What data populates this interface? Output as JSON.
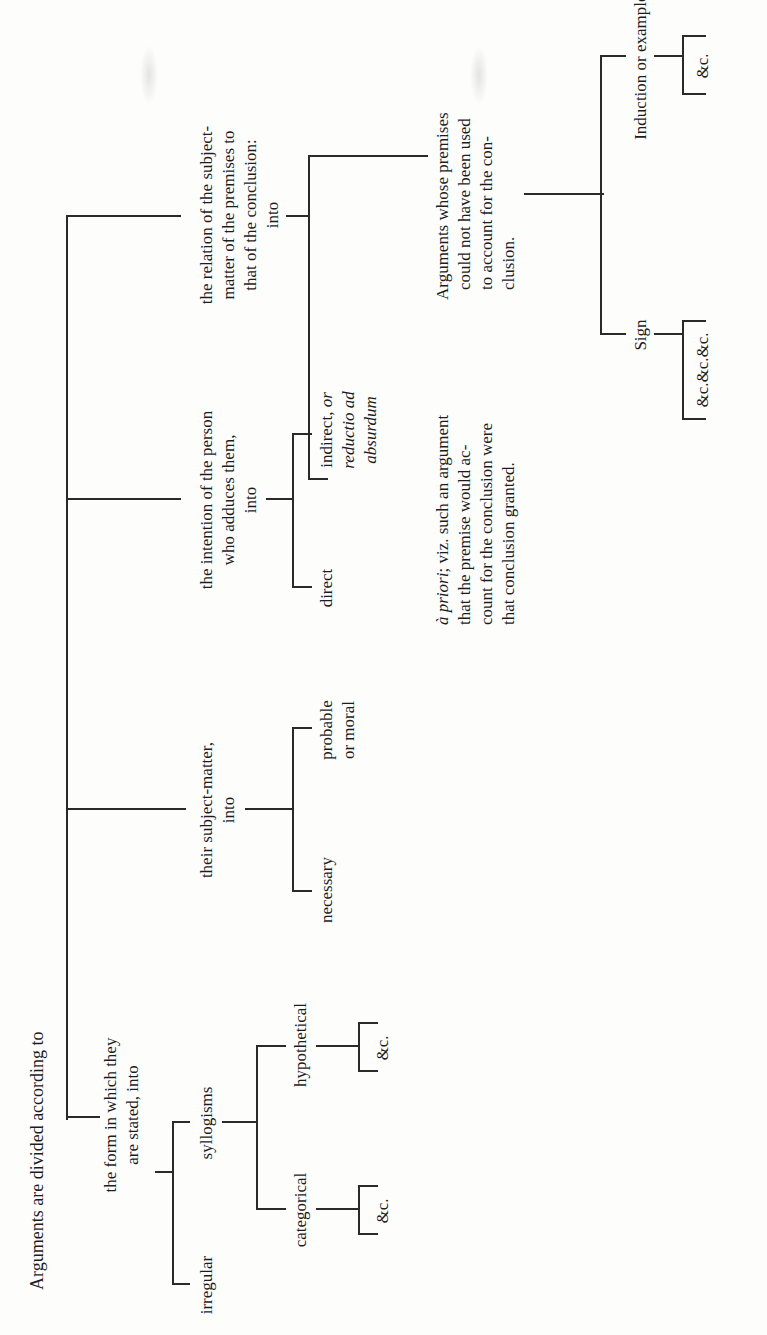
{
  "diagram": {
    "title": "Arguments are divided according to",
    "branches": [
      {
        "label_lines": [
          "the form in which they",
          "are stated, into"
        ],
        "children": [
          {
            "label": "irregular"
          },
          {
            "label": "syllogisms",
            "children": [
              {
                "label": "categorical",
                "children": [
                  {
                    "label": "&c."
                  }
                ]
              },
              {
                "label": "hypothetical",
                "children": [
                  {
                    "label": "&c."
                  }
                ]
              }
            ]
          }
        ]
      },
      {
        "label_lines": [
          "their subject-matter,",
          "into"
        ],
        "children": [
          {
            "label": "necessary"
          },
          {
            "label_lines": [
              "probable",
              "or moral"
            ]
          }
        ]
      },
      {
        "label_lines": [
          "the intention of the person",
          "who adduces them,",
          "into"
        ],
        "children": [
          {
            "label": "direct"
          },
          {
            "label_lines": [
              "indirect, or",
              "reductio ad",
              "absurdum"
            ],
            "italic_parts": [
              "or",
              "reductio ad",
              "absurdum"
            ]
          }
        ]
      },
      {
        "label_lines": [
          "the relation of the subject-",
          "matter of the premises to",
          "that of the conclusion:",
          "into"
        ],
        "children": [
          {
            "label_lines": [
              "à priori; viz. such an argument",
              "that the premise would ac-",
              "count for the conclusion were",
              "that conclusion granted."
            ],
            "italic_parts": [
              "à priori"
            ]
          },
          {
            "label_lines": [
              "Arguments whose premises",
              "could not have been used",
              "to account for the con-",
              "clusion."
            ],
            "children": [
              {
                "label": "Sign",
                "children": [
                  {
                    "label": "&c.&c.&c."
                  }
                ]
              },
              {
                "label": "Induction or example.",
                "children": [
                  {
                    "label": "&c."
                  }
                ]
              }
            ]
          }
        ]
      }
    ]
  },
  "text": {
    "root": "Arguments are divided according to",
    "form_1": "the form in which they",
    "form_2": "are stated, into",
    "irregular": "irregular",
    "syllogisms": "syllogisms",
    "categorical": "categorical",
    "hypothetical": "hypothetical",
    "etc": "&c.",
    "subject_1": "their subject-matter,",
    "subject_2": "into",
    "necessary": "necessary",
    "probable_1": "probable",
    "probable_2": "or moral",
    "intention_1": "the intention of the person",
    "intention_2": "who adduces them,",
    "intention_3": "into",
    "direct": "direct",
    "indirect_1a": "indirect, ",
    "indirect_1b": "or",
    "indirect_2": "reductio ad",
    "indirect_3": "absurdum",
    "relation_1": "the relation of the subject-",
    "relation_2": "matter of the premises to",
    "relation_3": "that of the conclusion:",
    "relation_4": "into",
    "apriori_1a": "à priori",
    "apriori_1b": "; viz. such an argument",
    "apriori_2": "that the premise would ac-",
    "apriori_3": "count for the conclusion were",
    "apriori_4": "that conclusion granted.",
    "whose_1": "Arguments whose premises",
    "whose_2": "could not have been used",
    "whose_3": "to account for the con-",
    "whose_4": "clusion.",
    "sign": "Sign",
    "sign_etc": "&c.&c.&c.",
    "induction": "Induction or example.",
    "induction_etc": "&c."
  },
  "colors": {
    "ink": "#1c1c1c",
    "lines": "#2a2a2a",
    "paper": "#fdfdfc"
  }
}
